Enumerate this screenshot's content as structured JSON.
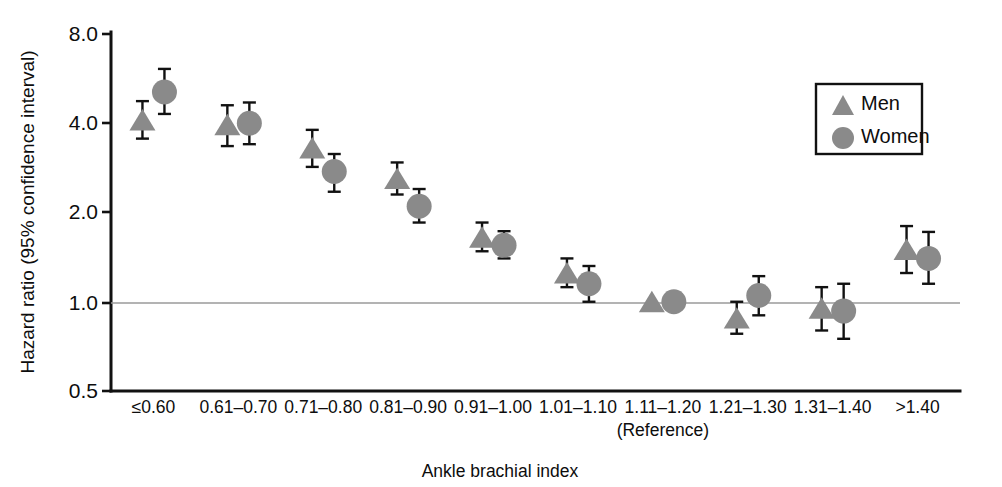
{
  "chart_data": {
    "type": "scatter",
    "title": "",
    "xlabel": "Ankle brachial index",
    "ylabel": "Hazard ratio (95% confidence interval)",
    "yscale": "log",
    "ylim": [
      0.5,
      8.0
    ],
    "yticks": [
      "0.5",
      "1.0",
      "2.0",
      "4.0",
      "8.0"
    ],
    "ytick_values": [
      0.5,
      1.0,
      2.0,
      4.0,
      8.0
    ],
    "grid": false,
    "reference_line": 1.0,
    "legend_position": "top-right",
    "categories": [
      "≤0.60",
      "0.61–0.70",
      "0.71–0.80",
      "0.81–0.90",
      "0.91–1.00",
      "1.01–1.10",
      "1.11–1.20",
      "1.21–1.30",
      "1.31–1.40",
      ">1.40"
    ],
    "category_sublabels": [
      "",
      "",
      "",
      "",
      "",
      "",
      "(Reference)",
      "",
      "",
      ""
    ],
    "series": [
      {
        "name": "Men",
        "marker": "triangle",
        "color": "#8a8a8a",
        "values": [
          4.1,
          3.95,
          3.3,
          2.6,
          1.65,
          1.25,
          1.0,
          0.88,
          0.95,
          1.5
        ],
        "ci_low": [
          3.55,
          3.35,
          2.85,
          2.3,
          1.48,
          1.12,
          1.0,
          0.78,
          0.8,
          1.25
        ],
        "ci_high": [
          4.75,
          4.6,
          3.8,
          2.95,
          1.85,
          1.4,
          1.0,
          1.0,
          1.12,
          1.8
        ]
      },
      {
        "name": "Women",
        "marker": "circle",
        "color": "#8a8a8a",
        "values": [
          5.1,
          4.0,
          2.75,
          2.1,
          1.55,
          1.15,
          1.0,
          1.05,
          0.93,
          1.4
        ],
        "ci_low": [
          4.3,
          3.4,
          2.35,
          1.85,
          1.4,
          1.0,
          1.0,
          0.9,
          0.75,
          1.15
        ],
        "ci_high": [
          6.1,
          4.7,
          3.15,
          2.4,
          1.73,
          1.32,
          1.0,
          1.22,
          1.15,
          1.72
        ]
      }
    ]
  },
  "legend": {
    "items": [
      {
        "label": "Men",
        "marker": "triangle"
      },
      {
        "label": "Women",
        "marker": "circle"
      }
    ]
  },
  "colors": {
    "marker_gray": "#8a8a8a",
    "axis_black": "#111111",
    "reference_gray": "#9a9a9a"
  }
}
